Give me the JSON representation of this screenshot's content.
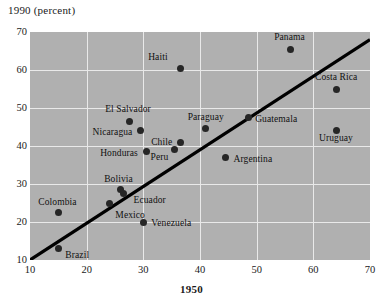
{
  "chart_data": {
    "type": "scatter",
    "title": "1990 (percent)",
    "xlabel": "1950",
    "ylabel": "1990 (percent)",
    "xlim": [
      10,
      70
    ],
    "ylim": [
      10,
      70
    ],
    "xticks": [
      10,
      20,
      30,
      40,
      50,
      60,
      70
    ],
    "yticks": [
      10,
      20,
      30,
      40,
      50,
      60,
      70
    ],
    "grid": true,
    "legend": "none",
    "plot_background": "#b0b0b0",
    "point_color": "#262626",
    "gridline_color": "#e9e9e9",
    "trend_line": {
      "name": "diagonal reference line",
      "color": "#000000",
      "x0": 10,
      "y0": 10,
      "x1": 70,
      "y1": 68
    },
    "points": [
      {
        "label": "Panama",
        "x": 56.0,
        "y": 65.5,
        "label_dx": -1,
        "label_dy": -12,
        "label_align": "center"
      },
      {
        "label": "Haiti",
        "x": 36.5,
        "y": 60.5,
        "label_dx": -12,
        "label_dy": -11,
        "label_align": "right"
      },
      {
        "label": "Costa Rica",
        "x": 64.0,
        "y": 55.0,
        "label_dx": 0,
        "label_dy": -12,
        "label_align": "center"
      },
      {
        "label": "El Salvador",
        "x": 27.5,
        "y": 46.5,
        "label_dx": -1,
        "label_dy": -12,
        "label_align": "center"
      },
      {
        "label": "Guatemala",
        "x": 48.5,
        "y": 47.5,
        "label_dx": 7,
        "label_dy": 1,
        "label_align": "left"
      },
      {
        "label": "Paraguay",
        "x": 41.0,
        "y": 44.5,
        "label_dx": 0,
        "label_dy": -12,
        "label_align": "center"
      },
      {
        "label": "Nicaragua",
        "x": 29.5,
        "y": 44.0,
        "label_dx": -8,
        "label_dy": 1,
        "label_align": "right"
      },
      {
        "label": "Uruguay",
        "x": 64.0,
        "y": 44.0,
        "label_dx": 0,
        "label_dy": 7,
        "label_align": "center"
      },
      {
        "label": "Chile",
        "x": 36.5,
        "y": 41.0,
        "label_dx": -8,
        "label_dy": 0,
        "label_align": "right"
      },
      {
        "label": "Peru",
        "x": 35.5,
        "y": 39.0,
        "label_dx": -6,
        "label_dy": 7,
        "label_align": "right"
      },
      {
        "label": "Honduras",
        "x": 30.5,
        "y": 38.5,
        "label_dx": -8,
        "label_dy": 1,
        "label_align": "right"
      },
      {
        "label": "Argentina",
        "x": 44.5,
        "y": 37.0,
        "label_dx": 8,
        "label_dy": 2,
        "label_align": "left"
      },
      {
        "label": "Bolivia",
        "x": 26.0,
        "y": 28.5,
        "label_dx": -2,
        "label_dy": -11,
        "label_align": "center"
      },
      {
        "label": "Ecuador",
        "x": 26.5,
        "y": 27.5,
        "label_dx": 10,
        "label_dy": 6,
        "label_align": "left"
      },
      {
        "label": "Mexico",
        "x": 24.0,
        "y": 25.0,
        "label_dx": 6,
        "label_dy": 12,
        "label_align": "left"
      },
      {
        "label": "Colombia",
        "x": 15.0,
        "y": 22.5,
        "label_dx": -1,
        "label_dy": -11,
        "label_align": "center"
      },
      {
        "label": "Venezuela",
        "x": 30.0,
        "y": 20.0,
        "label_dx": 8,
        "label_dy": 1,
        "label_align": "left"
      },
      {
        "label": "Brazil",
        "x": 15.0,
        "y": 13.0,
        "label_dx": 7,
        "label_dy": 6,
        "label_align": "left"
      }
    ]
  }
}
